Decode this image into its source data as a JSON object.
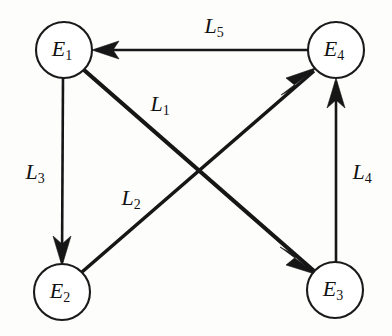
{
  "figure": {
    "background_color": "#fdfdfc",
    "ink_color": "#161616"
  },
  "nodes": [
    {
      "id": "E1",
      "base": "E",
      "subscript": "1",
      "cx": 64,
      "cy": 50,
      "r": 28,
      "name": "node-e1"
    },
    {
      "id": "E4",
      "base": "E",
      "subscript": "4",
      "cx": 336,
      "cy": 50,
      "r": 28,
      "name": "node-e4"
    },
    {
      "id": "E2",
      "base": "E",
      "subscript": "2",
      "cx": 62,
      "cy": 292,
      "r": 28,
      "name": "node-e2"
    },
    {
      "id": "E3",
      "base": "E",
      "subscript": "3",
      "cx": 335,
      "cy": 290,
      "r": 28,
      "name": "node-e3"
    }
  ],
  "edges": [
    {
      "id": "L5",
      "base": "L",
      "subscript": "5",
      "from": "E4",
      "to": "E1",
      "label_x": 214,
      "label_y": 28,
      "stroke_width": 2.6,
      "name": "edge-l5"
    },
    {
      "id": "L1",
      "base": "L",
      "subscript": "1",
      "from": "E1",
      "to": "E3",
      "label_x": 160,
      "label_y": 106,
      "stroke_width": 4.2,
      "name": "edge-l1"
    },
    {
      "id": "L2",
      "base": "L",
      "subscript": "2",
      "from": "E2",
      "to": "E4",
      "label_x": 131,
      "label_y": 200,
      "stroke_width": 3.6,
      "name": "edge-l2"
    },
    {
      "id": "L3",
      "base": "L",
      "subscript": "3",
      "from": "E1",
      "to": "E2",
      "label_x": 35,
      "label_y": 174,
      "stroke_width": 2.6,
      "name": "edge-l3"
    },
    {
      "id": "L4",
      "base": "L",
      "subscript": "4",
      "from": "E3",
      "to": "E4",
      "label_x": 362,
      "label_y": 174,
      "stroke_width": 2.6,
      "name": "edge-l4"
    }
  ]
}
